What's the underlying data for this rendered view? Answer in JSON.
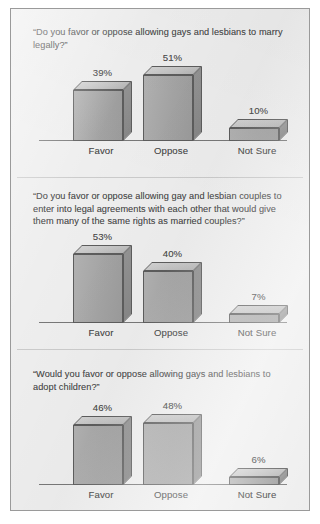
{
  "figure": {
    "background_color": "#eeeeee",
    "border_color": "#9a9a9a",
    "bar_front_color": "#a8a8a8",
    "bar_top_color": "#c6c6c6",
    "bar_side_color": "#8b8b8b",
    "bar_outline_color": "#5d5d5d",
    "axis_color": "#787878",
    "text_color": "#4c4c4c"
  },
  "chart_data": [
    {
      "type": "bar",
      "title": "“Do you favor or oppose allowing gays and lesbians to marry legally?”",
      "categories": [
        "Favor",
        "Oppose",
        "Not Sure"
      ],
      "values": [
        39,
        51,
        10
      ],
      "value_labels": [
        "39%",
        "51%",
        "10%"
      ],
      "xlabel": "",
      "ylabel": "",
      "ylim": [
        0,
        60
      ],
      "grid": false,
      "legend": "none",
      "three_d": true
    },
    {
      "type": "bar",
      "title": "“Do you favor or oppose allowing gay and lesbian couples to enter into legal agreements with each other that would give them many of the same rights as married couples?”",
      "categories": [
        "Favor",
        "Oppose",
        "Not Sure"
      ],
      "values": [
        53,
        40,
        7
      ],
      "value_labels": [
        "53%",
        "40%",
        "7%"
      ],
      "xlabel": "",
      "ylabel": "",
      "ylim": [
        0,
        60
      ],
      "grid": false,
      "legend": "none",
      "three_d": true
    },
    {
      "type": "bar",
      "title": "“Would you favor or oppose allowing gays and lesbians to adopt children?”",
      "categories": [
        "Favor",
        "Oppose",
        "Not Sure"
      ],
      "values": [
        46,
        48,
        6
      ],
      "value_labels": [
        "46%",
        "48%",
        "6%"
      ],
      "xlabel": "",
      "ylabel": "",
      "ylim": [
        0,
        60
      ],
      "grid": false,
      "legend": "none",
      "three_d": true
    }
  ]
}
